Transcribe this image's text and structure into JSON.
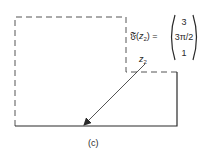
{
  "figure": {
    "caption": "(c)",
    "function_label": {
      "symbol": "𝔉",
      "open": "(",
      "var": "z",
      "sub": "2",
      "close": ") ="
    },
    "vector": [
      "3",
      "3π/2",
      "1"
    ],
    "point_label": {
      "var": "z",
      "sub": "2"
    },
    "colors": {
      "line": "#2a2a2a",
      "dashed": "#555555",
      "background": "#ffffff"
    }
  }
}
